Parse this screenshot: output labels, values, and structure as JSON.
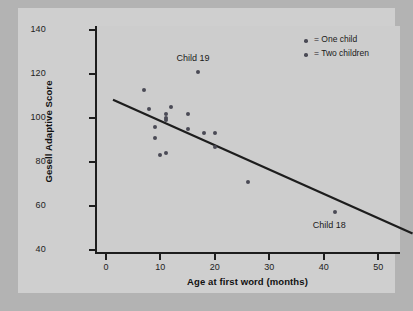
{
  "chart_data": {
    "type": "scatter",
    "title": "",
    "xlabel": "Age at first word (months)",
    "ylabel": "Gesell Adaptive Score",
    "xlim": [
      -2,
      54
    ],
    "ylim": [
      38,
      142
    ],
    "xticks": [
      0,
      10,
      20,
      30,
      40,
      50
    ],
    "yticks": [
      40,
      60,
      80,
      100,
      120,
      140
    ],
    "grid": false,
    "legend_position": "top-right",
    "legend": [
      {
        "marker": "dot",
        "label": "= One child",
        "color": "#4a4a55"
      },
      {
        "marker": "dot",
        "label": "= Two children",
        "color": "#56565f"
      }
    ],
    "series": [
      {
        "name": "Children",
        "color": "#4a4a55",
        "points": [
          {
            "x": 7,
            "y": 113
          },
          {
            "x": 8,
            "y": 104
          },
          {
            "x": 9,
            "y": 96
          },
          {
            "x": 9,
            "y": 91
          },
          {
            "x": 10,
            "y": 83
          },
          {
            "x": 11,
            "y": 84
          },
          {
            "x": 11,
            "y": 100
          },
          {
            "x": 11,
            "y": 99
          },
          {
            "x": 11,
            "y": 102
          },
          {
            "x": 12,
            "y": 105
          },
          {
            "x": 15,
            "y": 95
          },
          {
            "x": 15,
            "y": 102
          },
          {
            "x": 17,
            "y": 121
          },
          {
            "x": 18,
            "y": 93
          },
          {
            "x": 20,
            "y": 93
          },
          {
            "x": 20,
            "y": 87
          },
          {
            "x": 26,
            "y": 71
          },
          {
            "x": 42,
            "y": 57
          }
        ]
      }
    ],
    "regression_line": {
      "x_start": -2,
      "y_start": 112,
      "x_end": 53,
      "y_end": 51,
      "color": "#1d1d1d"
    },
    "annotations": [
      {
        "label": "Child 19",
        "x": 17,
        "y": 127
      },
      {
        "label": "Child 18",
        "x": 42,
        "y": 51
      }
    ]
  },
  "axes": {
    "y_title": "Gesell Adaptive Score",
    "x_title": "Age at first word (months)",
    "y_tick_labels": [
      "140",
      "120",
      "100",
      "80",
      "60",
      "40"
    ],
    "x_tick_labels": [
      "0",
      "10",
      "20",
      "30",
      "40",
      "50"
    ]
  },
  "legend": {
    "items": [
      {
        "label": "= One child"
      },
      {
        "label": "= Two children"
      }
    ]
  },
  "annotations": {
    "child19": "Child 19",
    "child18": "Child 18"
  },
  "colors": {
    "background": "#b3b3b3",
    "panel": "#cfcfcf",
    "axis": "#1d1d1d",
    "marker": "#4a4a55",
    "line": "#1d1d1d"
  }
}
